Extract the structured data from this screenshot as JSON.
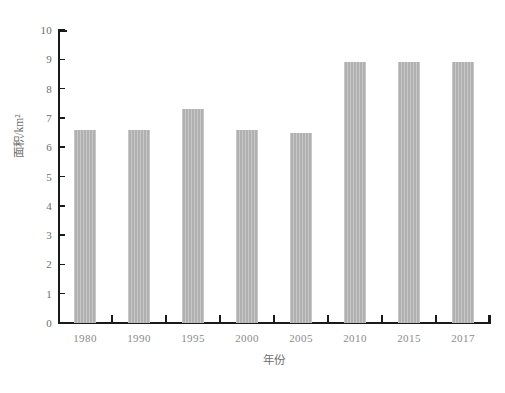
{
  "chart_data": {
    "type": "bar",
    "title": "",
    "subtitle": "",
    "xlabel": "年份",
    "ylabel": "面积/km²",
    "categories": [
      "1980",
      "1990",
      "1995",
      "2000",
      "2005",
      "2010",
      "2015",
      "2017"
    ],
    "values": [
      6.6,
      6.6,
      7.3,
      6.6,
      6.5,
      8.9,
      8.9,
      8.9
    ],
    "series": [
      {
        "name": "面积/km²",
        "values": [
          6.6,
          6.6,
          7.3,
          6.6,
          6.5,
          8.9,
          8.9,
          8.9
        ]
      }
    ],
    "ylim": [
      0,
      10
    ],
    "ytick_labels": [
      "10",
      "9",
      "8",
      "7",
      "6",
      "5",
      "4",
      "3",
      "2",
      "1",
      "0"
    ],
    "ytick_values": [
      10,
      9,
      8,
      7,
      6,
      5,
      4,
      3,
      2,
      1,
      0
    ],
    "ytick_step": 1,
    "grid": false,
    "legend": false,
    "legend_position": "none",
    "bar_color": "#b0b0b0",
    "axis_color": "#1a1a1a",
    "tick_label_color": "#8a8a8a",
    "axis_title_color": "#707070",
    "background_color": "#ffffff"
  }
}
